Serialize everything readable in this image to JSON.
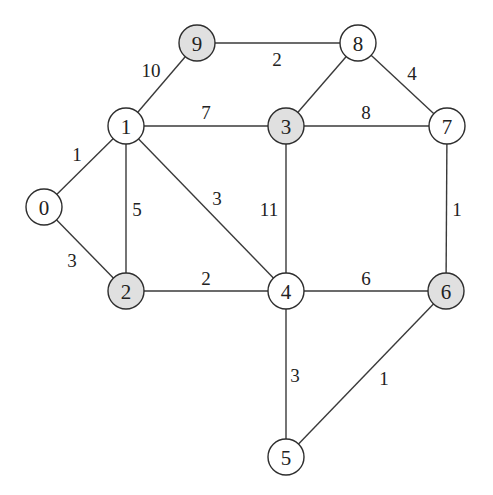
{
  "graph": {
    "title": "",
    "colors": {
      "default_fill": "#ffffff",
      "highlight_fill": "#e0e0e0",
      "stroke": "#2e2e2e"
    },
    "node_radius": 18,
    "nodes": [
      {
        "id": "0",
        "label": "0",
        "x": 44,
        "y": 207,
        "highlighted": false
      },
      {
        "id": "1",
        "label": "1",
        "x": 126,
        "y": 126,
        "highlighted": false
      },
      {
        "id": "2",
        "label": "2",
        "x": 126,
        "y": 291,
        "highlighted": true
      },
      {
        "id": "3",
        "label": "3",
        "x": 286,
        "y": 126,
        "highlighted": true
      },
      {
        "id": "4",
        "label": "4",
        "x": 286,
        "y": 291,
        "highlighted": false
      },
      {
        "id": "5",
        "label": "5",
        "x": 286,
        "y": 457,
        "highlighted": false
      },
      {
        "id": "6",
        "label": "6",
        "x": 446,
        "y": 291,
        "highlighted": true
      },
      {
        "id": "7",
        "label": "7",
        "x": 447,
        "y": 126,
        "highlighted": false
      },
      {
        "id": "8",
        "label": "8",
        "x": 358,
        "y": 43,
        "highlighted": false
      },
      {
        "id": "9",
        "label": "9",
        "x": 197,
        "y": 43,
        "highlighted": true
      }
    ],
    "edges": [
      {
        "from": "0",
        "to": "1",
        "weight": "1",
        "lx": 77,
        "ly": 154
      },
      {
        "from": "0",
        "to": "2",
        "weight": "3",
        "lx": 72,
        "ly": 260
      },
      {
        "from": "1",
        "to": "2",
        "weight": "5",
        "lx": 137,
        "ly": 209
      },
      {
        "from": "1",
        "to": "9",
        "weight": "10",
        "lx": 151,
        "ly": 70
      },
      {
        "from": "1",
        "to": "3",
        "weight": "7",
        "lx": 206,
        "ly": 112
      },
      {
        "from": "1",
        "to": "4",
        "weight": "3",
        "lx": 217,
        "ly": 198
      },
      {
        "from": "9",
        "to": "8",
        "weight": "2",
        "lx": 277,
        "ly": 59
      },
      {
        "from": "8",
        "to": "3",
        "weight": "",
        "lx": 0,
        "ly": 0
      },
      {
        "from": "8",
        "to": "7",
        "weight": "4",
        "lx": 412,
        "ly": 73
      },
      {
        "from": "3",
        "to": "7",
        "weight": "8",
        "lx": 366,
        "ly": 112
      },
      {
        "from": "3",
        "to": "4",
        "weight": "11",
        "lx": 269,
        "ly": 209
      },
      {
        "from": "7",
        "to": "6",
        "weight": "1",
        "lx": 457,
        "ly": 209
      },
      {
        "from": "2",
        "to": "4",
        "weight": "2",
        "lx": 206,
        "ly": 278
      },
      {
        "from": "4",
        "to": "6",
        "weight": "6",
        "lx": 366,
        "ly": 278
      },
      {
        "from": "4",
        "to": "5",
        "weight": "3",
        "lx": 295,
        "ly": 375
      },
      {
        "from": "6",
        "to": "5",
        "weight": "1",
        "lx": 384,
        "ly": 378
      }
    ]
  }
}
